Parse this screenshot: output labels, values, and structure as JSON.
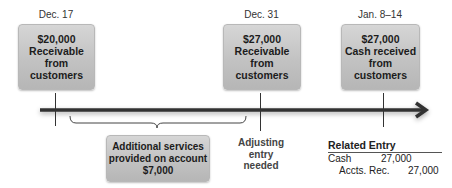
{
  "timeline": {
    "events": [
      {
        "date": "Dec. 17",
        "amount": "$20,000",
        "line1": "Receivable",
        "line2": "from",
        "line3": "customers"
      },
      {
        "date": "Dec. 31",
        "amount": "$27,000",
        "line1": "Receivable",
        "line2": "from",
        "line3": "customers"
      },
      {
        "date": "Jan. 8–14",
        "amount": "$27,000",
        "line1": "Cash received",
        "line2": "from",
        "line3": "customers"
      }
    ],
    "arrow_color": "#333333"
  },
  "additional_services": {
    "line1": "Additional services",
    "line2": "provided on account",
    "amount": "$7,000"
  },
  "adjusting": {
    "line1": "Adjusting",
    "line2": "entry",
    "line3": "needed"
  },
  "related_entry": {
    "title": "Related Entry",
    "debit_account": "Cash",
    "debit_amount": "27,000",
    "credit_account": "Accts. Rec.",
    "credit_amount": "27,000"
  }
}
